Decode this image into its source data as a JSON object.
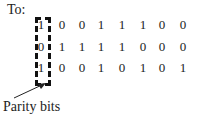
{
  "title": "To:",
  "label": "Parity bits",
  "rows": [
    {
      "parity": "1",
      "bits": [
        "0",
        "0",
        "1",
        "1",
        "1",
        "0",
        "0"
      ]
    },
    {
      "parity": "0",
      "bits": [
        "1",
        "1",
        "1",
        "1",
        "0",
        "0",
        "0"
      ]
    },
    {
      "parity": "1",
      "bits": [
        "0",
        "0",
        "1",
        "0",
        "1",
        "0",
        "1"
      ]
    }
  ]
}
